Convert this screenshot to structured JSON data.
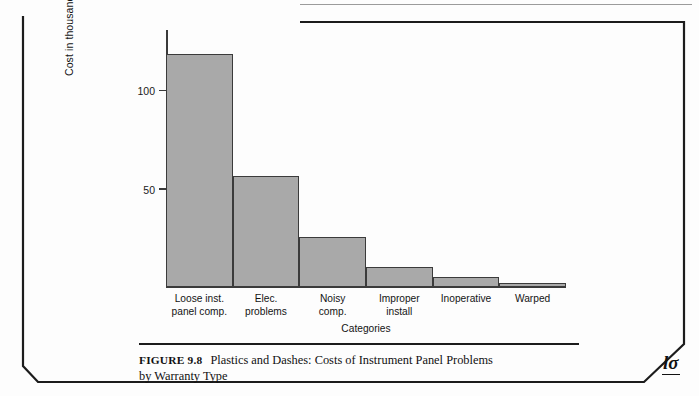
{
  "figure": {
    "number_label": "FIGURE 9.8",
    "caption_line1": "Plastics and Dashes: Costs of Instrument Panel Problems",
    "caption_line2": "by Warranty Type",
    "publisher_mark": "lσ"
  },
  "chart_data": {
    "type": "bar",
    "title": "",
    "categories": [
      "Loose inst. panel comp.",
      "Elec. problems",
      "Noisy comp.",
      "Improper install",
      "Inoperative",
      "Warped"
    ],
    "category_lines": [
      [
        "Loose inst.",
        "panel comp."
      ],
      [
        "Elec.",
        "problems"
      ],
      [
        "Noisy",
        "comp."
      ],
      [
        "Improper",
        "install"
      ],
      [
        "Inoperative",
        ""
      ],
      [
        "Warped",
        ""
      ]
    ],
    "values": [
      118,
      56,
      25,
      10,
      5,
      2
    ],
    "xlabel": "Categories",
    "ylabel": "Cost in thousands of dollars",
    "ytick_labels": [
      "50",
      "100"
    ],
    "ytick_values": [
      50,
      100
    ],
    "ylim": [
      0,
      130
    ],
    "grid": false,
    "legend": false,
    "bar_fill_color": "#a9a9a9",
    "bar_edge_color": "#3b3b3b",
    "axis_color": "#3a3a3a"
  }
}
